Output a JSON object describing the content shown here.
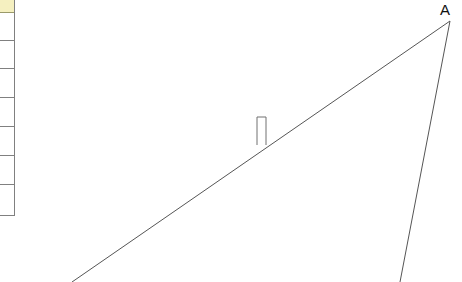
{
  "canvas": {
    "width": 462,
    "height": 282,
    "background": "#ffffff"
  },
  "spreadsheet_fragment": {
    "name": "partial-spreadsheet-column",
    "column_right_edge_x": 15,
    "border_color": "#808080",
    "header_fill": "#f5f0c0",
    "cell_fill": "#ffffff",
    "rows": [
      {
        "label": "",
        "height": 13,
        "is_header": true
      },
      {
        "label": "",
        "height": 28,
        "is_header": false
      },
      {
        "label": "",
        "height": 28,
        "is_header": false
      },
      {
        "label": "",
        "height": 29,
        "is_header": false
      },
      {
        "label": "",
        "height": 29,
        "is_header": false
      },
      {
        "label": "",
        "height": 29,
        "is_header": false
      },
      {
        "label": "",
        "height": 29,
        "is_header": false
      },
      {
        "label": "",
        "height": 31,
        "is_header": false
      }
    ]
  },
  "figure": {
    "name": "angle-diagram",
    "stroke_color": "#555555",
    "stroke_width": 1,
    "vertex_label": "A",
    "vertex_label_x": 440,
    "vertex_label_y": 2,
    "lines": [
      {
        "name": "hypotenuse-line",
        "x1": 72,
        "y1": 282,
        "x2": 450,
        "y2": 21
      },
      {
        "name": "descending-line",
        "x1": 450,
        "y1": 21,
        "x2": 400,
        "y2": 282
      }
    ],
    "right_angle_marker": {
      "name": "right-angle-marker",
      "x": 257,
      "y": 117,
      "width": 9,
      "height": 28,
      "stroke_color": "#707070"
    }
  }
}
